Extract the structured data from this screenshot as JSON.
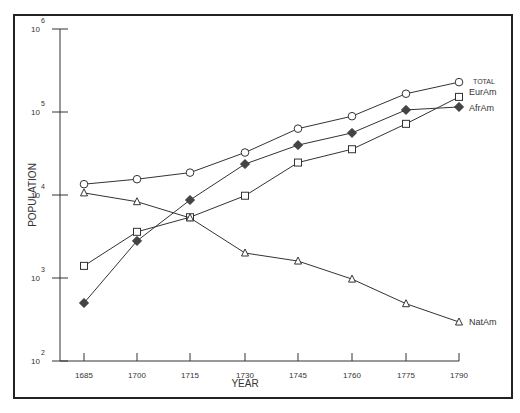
{
  "chart_data": {
    "type": "line",
    "title": "",
    "xlabel": "YEAR",
    "ylabel": "POPULATION",
    "yscale": "log",
    "ylim": [
      100,
      1000000
    ],
    "x": [
      1685,
      1700,
      1715,
      1730,
      1745,
      1760,
      1775,
      1790
    ],
    "x_tick_labels": [
      "1685",
      "1700",
      "1715",
      "1730",
      "1745",
      "1760",
      "1775",
      "1790"
    ],
    "y_ticks": [
      {
        "value": 100,
        "base": "10",
        "exp": "2"
      },
      {
        "value": 1000,
        "base": "10",
        "exp": "3"
      },
      {
        "value": 10000,
        "base": "10",
        "exp": "4"
      },
      {
        "value": 100000,
        "base": "10",
        "exp": "5"
      },
      {
        "value": 1000000,
        "base": "10",
        "exp": "6"
      }
    ],
    "grid": false,
    "legend_position": "inline-right",
    "series": [
      {
        "name": "TOTAL",
        "marker": "circle",
        "values": [
          13500,
          15500,
          18600,
          32500,
          63000,
          89000,
          166000,
          229000
        ]
      },
      {
        "name": "EurAm",
        "marker": "square",
        "values": [
          1400,
          3600,
          5400,
          9800,
          24600,
          35600,
          72000,
          152000
        ]
      },
      {
        "name": "AfrAm",
        "marker": "diamond-filled",
        "values": [
          500,
          2800,
          8700,
          23600,
          39900,
          56000,
          106000,
          115000
        ]
      },
      {
        "name": "NatAm",
        "marker": "triangle",
        "values": [
          10600,
          8300,
          5300,
          2000,
          1600,
          970,
          490,
          295
        ]
      }
    ]
  },
  "colors": {
    "line": "#333333",
    "frame": "#222222",
    "marker_fill_dark": "#444444"
  }
}
